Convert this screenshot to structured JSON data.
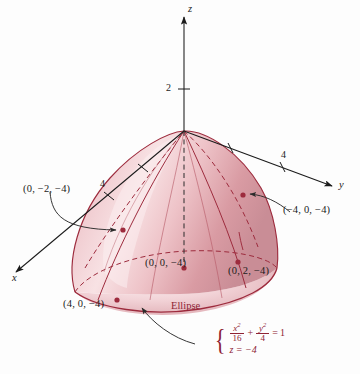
{
  "figure": {
    "type": "3d-surface-plot",
    "background": "#fdfdfd",
    "surface_colors": {
      "light": "#f7dde0",
      "mid": "#e8b4bb",
      "dark": "#cf8f98",
      "outline": "#9d2b3d",
      "accent": "#8e2334"
    }
  },
  "axes": {
    "z": {
      "label": "z",
      "tick_label": "2"
    },
    "y": {
      "label": "y",
      "tick_label": "4"
    },
    "x": {
      "label": "x",
      "tick_label": "4"
    }
  },
  "points": [
    {
      "name": "point-0-neg2-neg4",
      "label": "(0, −2, −4)"
    },
    {
      "name": "point-neg4-0-neg4",
      "label": "(−4, 0, −4)"
    },
    {
      "name": "point-0-0-neg4",
      "label": "(0, 0, −4)"
    },
    {
      "name": "point-0-2-neg4",
      "label": "(0, 2, −4)"
    },
    {
      "name": "point-4-0-neg4",
      "label": "(4, 0, −4)"
    }
  ],
  "annotation": {
    "ellipse_title": "Ellipse",
    "equation": {
      "brace": "{",
      "term1_num": "x",
      "term1_num_exp": "2",
      "term1_den": "16",
      "plus": "+",
      "term2_num": "y",
      "term2_num_exp": "2",
      "term2_den": "4",
      "equals": "=",
      "rhs": "1",
      "line2": "z = −4"
    }
  }
}
